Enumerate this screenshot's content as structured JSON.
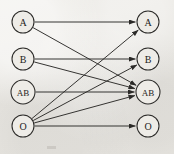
{
  "figure": {
    "name": "blood-type-compatibility-diagram",
    "background_color": "#e8e6e1",
    "ink_color": "#2b2a28",
    "node_fill_color": "#eeece7",
    "width": 174,
    "height": 154
  },
  "donors": {
    "column_label": "",
    "nodes": [
      {
        "id": "donor-a",
        "label": "A",
        "cx": 23,
        "cy": 22,
        "r": 11,
        "font_size": 10
      },
      {
        "id": "donor-b",
        "label": "B",
        "cx": 23,
        "cy": 59,
        "r": 11,
        "font_size": 10
      },
      {
        "id": "donor-ab",
        "label": "AB",
        "cx": 23,
        "cy": 92,
        "r": 12,
        "font_size": 9
      },
      {
        "id": "donor-o",
        "label": "O",
        "cx": 23,
        "cy": 126,
        "r": 11,
        "font_size": 10
      }
    ]
  },
  "recipients": {
    "column_label": "",
    "nodes": [
      {
        "id": "recipient-a",
        "label": "A",
        "cx": 148,
        "cy": 22,
        "r": 11,
        "font_size": 10
      },
      {
        "id": "recipient-b",
        "label": "B",
        "cx": 148,
        "cy": 59,
        "r": 11,
        "font_size": 10
      },
      {
        "id": "recipient-ab",
        "label": "AB",
        "cx": 148,
        "cy": 92,
        "r": 12,
        "font_size": 9
      },
      {
        "id": "recipient-o",
        "label": "O",
        "cx": 148,
        "cy": 126,
        "r": 11,
        "font_size": 10
      }
    ]
  },
  "edges": [
    {
      "id": "edge-a-a",
      "from": "donor-a",
      "to": "recipient-a"
    },
    {
      "id": "edge-a-ab",
      "from": "donor-a",
      "to": "recipient-ab"
    },
    {
      "id": "edge-b-b",
      "from": "donor-b",
      "to": "recipient-b"
    },
    {
      "id": "edge-b-ab",
      "from": "donor-b",
      "to": "recipient-ab"
    },
    {
      "id": "edge-ab-ab",
      "from": "donor-ab",
      "to": "recipient-ab"
    },
    {
      "id": "edge-o-a",
      "from": "donor-o",
      "to": "recipient-a"
    },
    {
      "id": "edge-o-b",
      "from": "donor-o",
      "to": "recipient-b"
    },
    {
      "id": "edge-o-ab",
      "from": "donor-o",
      "to": "recipient-ab"
    },
    {
      "id": "edge-o-o",
      "from": "donor-o",
      "to": "recipient-o"
    }
  ],
  "artifacts": [
    {
      "id": "smudge-bottom-left",
      "x": 47,
      "y": 146,
      "width": 9,
      "height": 3
    }
  ]
}
